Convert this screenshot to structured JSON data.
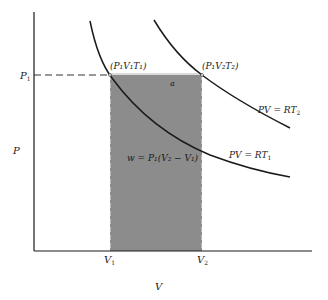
{
  "diagram": {
    "axes": {
      "y_label": "P",
      "x_label": "V",
      "y_tick": "P",
      "y_tick_sub": "1",
      "x_ticks": [
        {
          "text": "V",
          "sub": "1"
        },
        {
          "text": "V",
          "sub": "2"
        }
      ]
    },
    "points": [
      {
        "text": "(P₁V₁T₁)"
      },
      {
        "text": "(P₁V₂T₂)"
      }
    ],
    "curves": [
      {
        "label": "PV = RT",
        "sub": "2"
      },
      {
        "label": "PV = RT",
        "sub": "1"
      }
    ],
    "arrow_label": "a",
    "work_label": "w = P₁(V₂ − V₁)",
    "colors": {
      "shaded_region": "#8c8c8c",
      "line": "#1a1a1a",
      "background": "#ffffff"
    }
  }
}
